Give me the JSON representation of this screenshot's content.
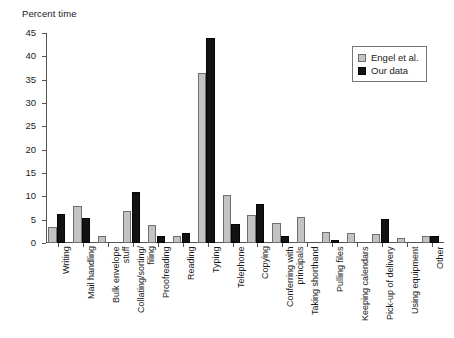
{
  "chart_data": {
    "type": "bar",
    "title": "",
    "ylabel": "Percent time",
    "xlabel": "",
    "ylim": [
      0,
      45
    ],
    "ytick_step": 5,
    "yticks": [
      0,
      5,
      10,
      15,
      20,
      25,
      30,
      35,
      40,
      45
    ],
    "grid": false,
    "legend_position": "top-right",
    "categories": [
      "Writing",
      "Mail handling",
      "Bulk envelope stuff",
      "Collating/sorting/ filing",
      "Proofreading",
      "Reading",
      "Typing",
      "Telephone",
      "Copying",
      "Conferring with principals",
      "Taking shorthand",
      "Pulling files",
      "Keeping calendars",
      "Pick-up of delivery",
      "Using equipment",
      "Other"
    ],
    "category_lines": [
      [
        "Writing",
        ""
      ],
      [
        "Mail handling",
        ""
      ],
      [
        "Bulk envelope",
        "stuff"
      ],
      [
        "Collating/sorting/",
        "filing"
      ],
      [
        "Proofreading",
        ""
      ],
      [
        "Reading",
        ""
      ],
      [
        "Typing",
        ""
      ],
      [
        "Telephone",
        ""
      ],
      [
        "Copying",
        ""
      ],
      [
        "Conferring with",
        "principals"
      ],
      [
        "Taking shorthand",
        ""
      ],
      [
        "Pulling files",
        ""
      ],
      [
        "Keeping calendars",
        ""
      ],
      [
        "Pick-up of delivery",
        ""
      ],
      [
        "Using equipment",
        ""
      ],
      [
        "Other",
        ""
      ]
    ],
    "series": [
      {
        "name": "Engel et al.",
        "color": "#c3c3c3",
        "values": [
          3.5,
          8.0,
          1.5,
          6.8,
          3.8,
          1.5,
          36.5,
          10.3,
          6.0,
          4.3,
          5.5,
          2.4,
          2.2,
          1.9,
          1.0,
          1.5
        ]
      },
      {
        "name": "Our data",
        "color": "#121212",
        "values": [
          6.2,
          5.4,
          0.0,
          11.0,
          1.5,
          2.1,
          44.0,
          4.1,
          8.4,
          1.5,
          0.0,
          0.7,
          0.0,
          5.2,
          0.0,
          1.6
        ]
      }
    ]
  },
  "legend": {
    "entries": [
      {
        "label": "Engel et al."
      },
      {
        "label": "Our data"
      }
    ]
  },
  "axis": {
    "y_title": "Percent time"
  }
}
